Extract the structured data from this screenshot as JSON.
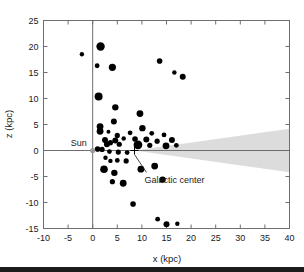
{
  "chart_data": {
    "type": "scatter",
    "title": "",
    "xlabel": "x (kpc)",
    "ylabel": "z (kpc)",
    "xlim": [
      -10,
      40
    ],
    "ylim": [
      -15,
      25
    ],
    "xticks": [
      -10,
      -5,
      0,
      5,
      10,
      15,
      20,
      25,
      30,
      35,
      40
    ],
    "xtick_labels": [
      "-10",
      "-5",
      "0",
      "5",
      "10",
      "15",
      "20",
      "25",
      "30",
      "35",
      "40"
    ],
    "yticks": [
      -15,
      -10,
      -5,
      0,
      5,
      10,
      15,
      20,
      25
    ],
    "ytick_labels": [
      "-15",
      "-10",
      "-5",
      "0",
      "5",
      "10",
      "15",
      "20",
      "25"
    ],
    "grid": false,
    "legend": null,
    "points": [
      {
        "x": -2.2,
        "z": 18.5,
        "size": 2.2
      },
      {
        "x": 1.6,
        "z": 20.0,
        "size": 4.2
      },
      {
        "x": 0.9,
        "z": 16.3,
        "size": 2.4
      },
      {
        "x": 4.0,
        "z": 16.0,
        "size": 3.6
      },
      {
        "x": 13.6,
        "z": 17.2,
        "size": 2.8
      },
      {
        "x": 16.6,
        "z": 15.0,
        "size": 2.2
      },
      {
        "x": 18.3,
        "z": 14.2,
        "size": 3.0
      },
      {
        "x": 1.2,
        "z": 10.4,
        "size": 4.0
      },
      {
        "x": 4.6,
        "z": 8.3,
        "size": 3.2
      },
      {
        "x": 9.6,
        "z": 7.1,
        "size": 3.4
      },
      {
        "x": 4.3,
        "z": 5.6,
        "size": 3.0
      },
      {
        "x": 1.5,
        "z": 4.6,
        "size": 3.4
      },
      {
        "x": 1.5,
        "z": 3.7,
        "size": 3.4
      },
      {
        "x": 10.1,
        "z": 4.3,
        "size": 3.2
      },
      {
        "x": 5.0,
        "z": 2.9,
        "size": 2.6
      },
      {
        "x": 3.2,
        "z": 3.6,
        "size": 2.0
      },
      {
        "x": 7.6,
        "z": 3.4,
        "size": 2.4
      },
      {
        "x": 12.0,
        "z": 3.3,
        "size": 2.4
      },
      {
        "x": 14.5,
        "z": 3.0,
        "size": 2.4
      },
      {
        "x": 2.5,
        "z": 2.0,
        "size": 3.0
      },
      {
        "x": 4.6,
        "z": 1.9,
        "size": 3.0
      },
      {
        "x": 6.3,
        "z": 2.3,
        "size": 2.2
      },
      {
        "x": 8.6,
        "z": 2.2,
        "size": 2.8
      },
      {
        "x": 10.9,
        "z": 2.1,
        "size": 3.0
      },
      {
        "x": 13.1,
        "z": 1.8,
        "size": 2.6
      },
      {
        "x": 16.1,
        "z": 2.0,
        "size": 3.0
      },
      {
        "x": 2.9,
        "z": 1.2,
        "size": 3.0
      },
      {
        "x": 3.6,
        "z": 1.5,
        "size": 2.6
      },
      {
        "x": 5.4,
        "z": 1.2,
        "size": 2.6
      },
      {
        "x": 9.2,
        "z": 1.1,
        "size": 4.4
      },
      {
        "x": 11.6,
        "z": 1.0,
        "size": 2.6
      },
      {
        "x": 14.9,
        "z": 0.9,
        "size": 3.4
      },
      {
        "x": 17.0,
        "z": 1.0,
        "size": 2.4
      },
      {
        "x": 1.0,
        "z": 0.3,
        "size": 2.8
      },
      {
        "x": 1.9,
        "z": 0.2,
        "size": 2.6
      },
      {
        "x": 3.4,
        "z": -0.2,
        "size": 2.4
      },
      {
        "x": 5.2,
        "z": -0.3,
        "size": 2.6
      },
      {
        "x": 7.0,
        "z": -0.4,
        "size": 2.4
      },
      {
        "x": 2.6,
        "z": -1.4,
        "size": 2.2
      },
      {
        "x": 3.6,
        "z": -2.0,
        "size": 2.2
      },
      {
        "x": 5.0,
        "z": -1.9,
        "size": 2.4
      },
      {
        "x": 6.8,
        "z": -2.0,
        "size": 2.6
      },
      {
        "x": 2.3,
        "z": -3.6,
        "size": 3.8
      },
      {
        "x": 4.4,
        "z": -4.3,
        "size": 3.2
      },
      {
        "x": 9.8,
        "z": -3.6,
        "size": 3.4
      },
      {
        "x": 12.6,
        "z": -3.0,
        "size": 3.4
      },
      {
        "x": 4.0,
        "z": -6.0,
        "size": 2.6
      },
      {
        "x": 6.2,
        "z": -6.3,
        "size": 3.4
      },
      {
        "x": 14.2,
        "z": -5.6,
        "size": 3.2
      },
      {
        "x": 8.2,
        "z": -10.3,
        "size": 2.8
      },
      {
        "x": 13.2,
        "z": -13.2,
        "size": 2.4
      },
      {
        "x": 15.0,
        "z": -14.2,
        "size": 3.0
      },
      {
        "x": 17.2,
        "z": -14.1,
        "size": 2.2
      }
    ],
    "annotations": [
      {
        "name": "sun",
        "label": "Sun",
        "x": 0,
        "z": 0,
        "marker": "dot"
      },
      {
        "name": "galactic-center",
        "label": "Galactic center",
        "x": 8.5,
        "z": 0,
        "marker": "plus"
      }
    ],
    "shaded_region": {
      "name": "galactic-disk-wedge",
      "color": "#dcdcdc",
      "apex_x": 8.5,
      "apex_z": 0,
      "edge_x": 40,
      "edge_z_top": 4.2,
      "edge_z_bottom": -4.2
    }
  }
}
